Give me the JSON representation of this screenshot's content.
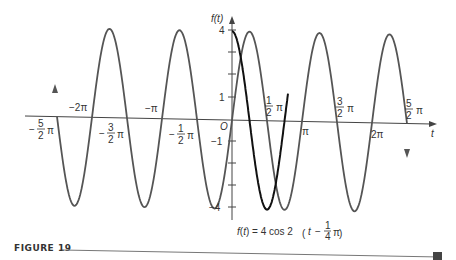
{
  "figure": {
    "caption_label": "FIGURE 19",
    "equation": {
      "lhs": "f(t) = 4 cos 2",
      "inner": "t −",
      "frac_num": "1",
      "frac_den": "4",
      "pi": "π"
    },
    "y_axis_label": "f(t)",
    "x_axis_label": "t",
    "origin_label": "O"
  },
  "chart_data": {
    "type": "line",
    "title": "",
    "caption": "FIGURE 19",
    "annotation": "f(t) = 4 cos 2(t − ¼π)",
    "xlabel": "t",
    "ylabel": "f(t)",
    "xlim": [
      -2.6,
      2.6
    ],
    "xlim_units": "π",
    "ylim": [
      -4,
      4
    ],
    "x_ticks": [
      {
        "value": -2.5,
        "label": "−5/2 π"
      },
      {
        "value": -2,
        "label": "−2π"
      },
      {
        "value": -1.5,
        "label": "−3/2 π"
      },
      {
        "value": -1,
        "label": "−π"
      },
      {
        "value": -0.5,
        "label": "−1/2 π"
      },
      {
        "value": 0.5,
        "label": "1/2 π"
      },
      {
        "value": 1,
        "label": "π"
      },
      {
        "value": 1.5,
        "label": "3/2 π"
      },
      {
        "value": 2,
        "label": "2π"
      },
      {
        "value": 2.5,
        "label": "5/2 π"
      }
    ],
    "y_ticks": [
      {
        "value": 4,
        "label": "4"
      },
      {
        "value": 1,
        "label": "1"
      },
      {
        "value": -1,
        "label": "−1"
      },
      {
        "value": -4,
        "label": "−4"
      }
    ],
    "grid": false,
    "series": [
      {
        "name": "f(t) = 4 cos 2(t − ¼π)",
        "color": "#555555",
        "x_range_pi": [
          -2.5,
          2.5
        ],
        "amplitude": 4,
        "period_pi": 1,
        "phase_shift_pi": 0.25,
        "points": [
          {
            "x_pi": -2.5,
            "y": 0
          },
          {
            "x_pi": -2.25,
            "y": -4
          },
          {
            "x_pi": -2,
            "y": 0
          },
          {
            "x_pi": -1.75,
            "y": 4
          },
          {
            "x_pi": -1.5,
            "y": 0
          },
          {
            "x_pi": -1.25,
            "y": -4
          },
          {
            "x_pi": -1,
            "y": 0
          },
          {
            "x_pi": -0.75,
            "y": 4
          },
          {
            "x_pi": -0.5,
            "y": 0
          },
          {
            "x_pi": -0.25,
            "y": -4
          },
          {
            "x_pi": 0,
            "y": 0
          },
          {
            "x_pi": 0.25,
            "y": 4
          },
          {
            "x_pi": 0.5,
            "y": 0
          },
          {
            "x_pi": 0.75,
            "y": -4
          },
          {
            "x_pi": 1,
            "y": 0
          },
          {
            "x_pi": 1.25,
            "y": 4
          },
          {
            "x_pi": 1.5,
            "y": 0
          },
          {
            "x_pi": 1.75,
            "y": -4
          },
          {
            "x_pi": 2,
            "y": 0
          },
          {
            "x_pi": 2.25,
            "y": 4
          },
          {
            "x_pi": 2.5,
            "y": 0
          }
        ]
      },
      {
        "name": "4 cos 2t (reference)",
        "color": "#111111",
        "x_range_pi": [
          0,
          0.8
        ],
        "points": [
          {
            "x_pi": 0,
            "y": 4
          },
          {
            "x_pi": 0.25,
            "y": 0
          },
          {
            "x_pi": 0.5,
            "y": -4
          },
          {
            "x_pi": 0.75,
            "y": 0
          },
          {
            "x_pi": 0.8,
            "y": 1.2
          }
        ]
      }
    ]
  }
}
